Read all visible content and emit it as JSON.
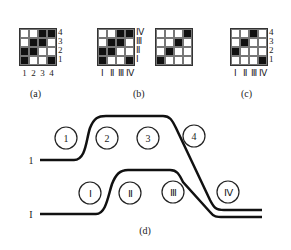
{
  "panels": {
    "a": {
      "caption": "(a)",
      "rows": [
        [
          0,
          0,
          1,
          1
        ],
        [
          0,
          1,
          1,
          0
        ],
        [
          1,
          1,
          0,
          0
        ],
        [
          1,
          0,
          0,
          1
        ]
      ],
      "row_labels": [
        "4",
        "3",
        "2",
        "1"
      ],
      "col_labels": [
        "1",
        "2",
        "3",
        "4"
      ]
    },
    "b": {
      "caption": "(b)",
      "left_rows": [
        [
          0,
          0,
          1,
          1
        ],
        [
          0,
          1,
          1,
          0
        ],
        [
          1,
          1,
          0,
          0
        ],
        [
          1,
          0,
          0,
          1
        ]
      ],
      "right_rows": [
        [
          0,
          0,
          0,
          1
        ],
        [
          0,
          0,
          1,
          0
        ],
        [
          0,
          1,
          0,
          0
        ],
        [
          1,
          0,
          0,
          0
        ]
      ],
      "row_labels": [
        "Ⅳ",
        "Ⅲ",
        "Ⅱ",
        "Ⅰ"
      ],
      "col_labels": [
        "Ⅰ",
        "Ⅱ",
        "Ⅲ",
        "Ⅳ"
      ]
    },
    "c": {
      "caption": "(c)",
      "rows": [
        [
          0,
          0,
          1,
          0
        ],
        [
          0,
          1,
          0,
          0
        ],
        [
          1,
          0,
          0,
          0
        ],
        [
          0,
          0,
          0,
          1
        ]
      ],
      "row_labels": [
        "4",
        "3",
        "2",
        "1"
      ],
      "col_labels": [
        "Ⅰ",
        "Ⅱ",
        "Ⅲ",
        "Ⅳ"
      ]
    },
    "d": {
      "caption": "(d)",
      "upper_path_label": "1",
      "lower_path_label": "I",
      "upper_circles": [
        "1",
        "2",
        "3",
        "4"
      ],
      "lower_circles": [
        "Ⅰ",
        "Ⅱ",
        "Ⅲ",
        "Ⅳ"
      ]
    }
  }
}
